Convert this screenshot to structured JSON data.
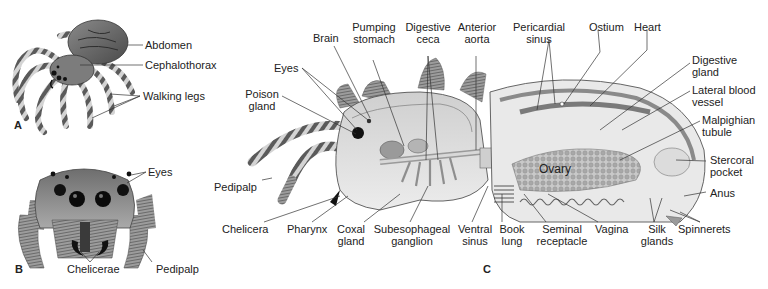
{
  "figure": {
    "title_fragment": "",
    "panels": [
      {
        "id": "A",
        "letter": "A",
        "description": "Jumping spider, dorsal-lateral view",
        "labels": [
          "Abdomen",
          "Cephalothorax",
          "Walking legs"
        ]
      },
      {
        "id": "B",
        "letter": "B",
        "description": "Jumping spider head, frontal view",
        "labels": [
          "Eyes",
          "Chelicerae",
          "Pedipalp"
        ]
      },
      {
        "id": "C",
        "letter": "C",
        "description": "Internal anatomy of spider, sagittal section",
        "labels_top": [
          {
            "line1": "Brain",
            "line2": ""
          },
          {
            "line1": "Pumping",
            "line2": "stomach"
          },
          {
            "line1": "Digestive",
            "line2": "ceca"
          },
          {
            "line1": "Anterior",
            "line2": "aorta"
          },
          {
            "line1": "Pericardial",
            "line2": "sinus"
          },
          {
            "line1": "Ostium",
            "line2": ""
          },
          {
            "line1": "Heart",
            "line2": ""
          }
        ],
        "labels_left": [
          {
            "line1": "Eyes",
            "line2": ""
          },
          {
            "line1": "Poison",
            "line2": "gland"
          },
          {
            "line1": "Pedipalp",
            "line2": ""
          }
        ],
        "labels_right": [
          {
            "line1": "Digestive",
            "line2": "gland"
          },
          {
            "line1": "Lateral blood",
            "line2": "vessel"
          },
          {
            "line1": "Malpighian",
            "line2": "tubule"
          },
          {
            "line1": "Stercoral",
            "line2": "pocket"
          },
          {
            "line1": "Anus",
            "line2": ""
          }
        ],
        "labels_bottom": [
          {
            "line1": "Chelicera",
            "line2": ""
          },
          {
            "line1": "Pharynx",
            "line2": ""
          },
          {
            "line1": "Coxal",
            "line2": "gland"
          },
          {
            "line1": "Subesophageal",
            "line2": "ganglion"
          },
          {
            "line1": "Ventral",
            "line2": "sinus"
          },
          {
            "line1": "Book",
            "line2": "lung"
          },
          {
            "line1": "Seminal",
            "line2": "receptacle"
          },
          {
            "line1": "Vagina",
            "line2": ""
          },
          {
            "line1": "Silk",
            "line2": "glands"
          },
          {
            "line1": "Spinnerets",
            "line2": ""
          }
        ],
        "labels_inside": [
          "Ovary"
        ]
      }
    ]
  }
}
